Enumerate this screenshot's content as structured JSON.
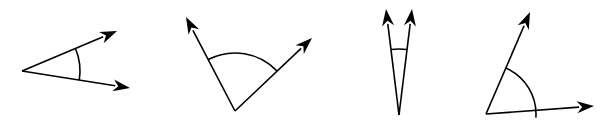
{
  "figure": {
    "canvas": {
      "width": 606,
      "height": 128
    },
    "background_color": "#ffffff",
    "stroke_color": "#000000",
    "stroke_width": 1.6,
    "arrow_fill_color": "#000000",
    "angles": [
      {
        "id": "angle-1",
        "name": "acute-angle-narrow-right-opening",
        "label": "",
        "classification": "acute",
        "measure_degrees": 25,
        "vertex": {
          "x": 22,
          "y": 71
        },
        "rays": [
          {
            "name": "upper-ray",
            "tip": {
              "x": 117,
              "y": 31
            },
            "direction_degrees": 22.8,
            "length": 103
          },
          {
            "name": "lower-ray",
            "tip": {
              "x": 130,
              "y": 88
            },
            "direction_degrees": -9.1,
            "length": 109
          }
        ],
        "arc": {
          "radius": 58,
          "start_degrees": -9.1,
          "end_degrees": 22.8
        },
        "arrow_size": {
          "length": 17,
          "half_width": 6
        }
      },
      {
        "id": "angle-2",
        "name": "obtuse-angle-upward-opening",
        "label": "",
        "classification": "obtuse",
        "measure_degrees": 105,
        "vertex": {
          "x": 235,
          "y": 111
        },
        "rays": [
          {
            "name": "left-ray",
            "tip": {
              "x": 186,
              "y": 17
            },
            "direction_degrees": 117.5,
            "length": 106
          },
          {
            "name": "right-ray",
            "tip": {
              "x": 312,
              "y": 38
            },
            "direction_degrees": 43.4,
            "length": 106
          }
        ],
        "arc": {
          "radius": 58,
          "start_degrees": 43.4,
          "end_degrees": 117.5
        },
        "arrow_size": {
          "length": 17,
          "half_width": 6
        }
      },
      {
        "id": "angle-3",
        "name": "very-acute-angle-upward-opening",
        "label": "",
        "classification": "acute",
        "measure_degrees": 13,
        "vertex": {
          "x": 399,
          "y": 115
        },
        "rays": [
          {
            "name": "left-ray",
            "tip": {
              "x": 386,
              "y": 9
            },
            "direction_degrees": 96.9,
            "length": 107
          },
          {
            "name": "right-ray",
            "tip": {
              "x": 412,
              "y": 9
            },
            "direction_degrees": 83.0,
            "length": 107
          }
        ],
        "arc": {
          "radius": 66,
          "start_degrees": 83.0,
          "end_degrees": 96.9
        },
        "arrow_size": {
          "length": 17,
          "half_width": 6
        }
      },
      {
        "id": "angle-4",
        "name": "acute-angle-with-horizontal-base",
        "label": "",
        "classification": "acute",
        "measure_degrees": 69,
        "vertex": {
          "x": 486,
          "y": 114
        },
        "rays": [
          {
            "name": "upper-ray",
            "tip": {
              "x": 530,
              "y": 12
            },
            "direction_degrees": 66.7,
            "length": 111
          },
          {
            "name": "horizontal-ray",
            "tip": {
              "x": 594,
              "y": 106
            },
            "direction_degrees": -4.2,
            "length": 108
          }
        ],
        "arc": {
          "radius": 50,
          "start_degrees": -4.2,
          "end_degrees": 66.7
        },
        "arrow_size": {
          "length": 17,
          "half_width": 6
        }
      }
    ]
  }
}
